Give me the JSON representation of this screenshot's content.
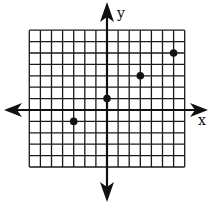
{
  "chart_data": {
    "type": "scatter",
    "title": "",
    "xlabel": "x",
    "ylabel": "y",
    "grid": true,
    "xlim": [
      -7,
      7
    ],
    "ylim": [
      -5,
      7
    ],
    "points": [
      {
        "x": -3,
        "y": -1
      },
      {
        "x": 0,
        "y": 1
      },
      {
        "x": 3,
        "y": 3
      },
      {
        "x": 6,
        "y": 5
      }
    ],
    "legend": null
  },
  "layout": {
    "origin_px": [
      107,
      110
    ],
    "unit_x_px": 11.1,
    "unit_y_px": 11.4,
    "grid_left": -7,
    "grid_right": 7,
    "grid_top": 7,
    "grid_bottom": -5,
    "line_color": "#1a1a1a",
    "point_color": "#111111"
  },
  "labels": {
    "x_axis": "x",
    "y_axis": "y"
  }
}
